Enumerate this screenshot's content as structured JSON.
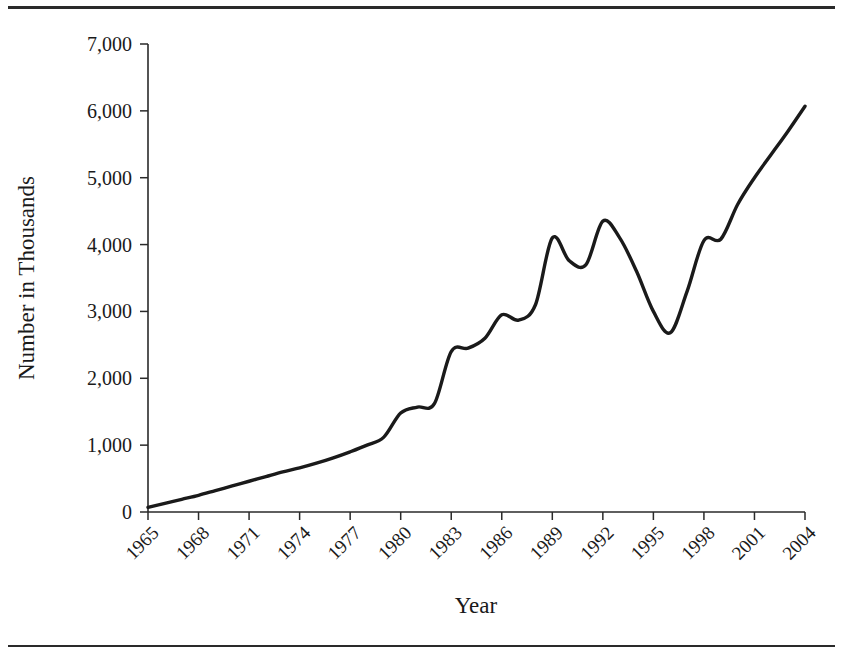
{
  "figure": {
    "top_rule": "",
    "bottom_rule": ""
  },
  "chart_data": {
    "type": "line",
    "title": "",
    "xlabel": "Year",
    "ylabel": "Number in Thousands",
    "xlim": [
      1965,
      2004
    ],
    "ylim": [
      0,
      7000
    ],
    "grid": false,
    "legend": null,
    "y_ticks": [
      0,
      1000,
      2000,
      3000,
      4000,
      5000,
      6000,
      7000
    ],
    "y_tick_labels": [
      "0",
      "1,000",
      "2,000",
      "3,000",
      "4,000",
      "5,000",
      "6,000",
      "7,000"
    ],
    "x_ticks": [
      1965,
      1968,
      1971,
      1974,
      1977,
      1980,
      1983,
      1986,
      1989,
      1992,
      1995,
      1998,
      2001,
      2004
    ],
    "x_tick_labels": [
      "1965",
      "1968",
      "1971",
      "1974",
      "1977",
      "1980",
      "1983",
      "1986",
      "1989",
      "1992",
      "1995",
      "1998",
      "2001",
      "2004"
    ],
    "x_tick_rotation": 45,
    "series": [
      {
        "name": "Number in Thousands",
        "color": "#1a1a1a",
        "x": [
          1965,
          1966,
          1967,
          1968,
          1969,
          1970,
          1971,
          1972,
          1973,
          1974,
          1975,
          1976,
          1977,
          1978,
          1979,
          1980,
          1981,
          1982,
          1983,
          1984,
          1985,
          1986,
          1987,
          1988,
          1989,
          1990,
          1991,
          1992,
          1993,
          1994,
          1995,
          1996,
          1997,
          1998,
          1999,
          2000,
          2001,
          2002,
          2003,
          2004
        ],
        "values": [
          70,
          130,
          190,
          250,
          320,
          390,
          460,
          530,
          600,
          660,
          730,
          810,
          900,
          1000,
          1120,
          1480,
          1570,
          1620,
          2400,
          2450,
          2600,
          2950,
          2870,
          3100,
          4100,
          3760,
          3700,
          4350,
          4100,
          3600,
          3000,
          2680,
          3300,
          4060,
          4080,
          4600,
          5000,
          5350,
          5700,
          6070
        ]
      }
    ]
  }
}
